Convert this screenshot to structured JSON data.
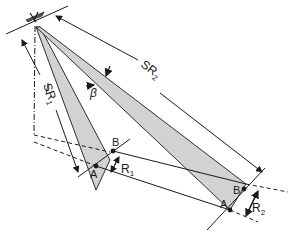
{
  "diagram": {
    "labels": {
      "sr1": "SR",
      "sr1_sub": "1",
      "sr2": "SR",
      "sr2_sub": "2",
      "beta": "β",
      "r1": "R",
      "r1_sub": "1",
      "r2": "R",
      "r2_sub": "2",
      "a_near": "A",
      "b_near": "B",
      "a_far": "A",
      "b_far": "B"
    },
    "colors": {
      "beam_fill": "#d2d2d2",
      "line": "#1a1a1a",
      "background": "#ffffff"
    }
  }
}
